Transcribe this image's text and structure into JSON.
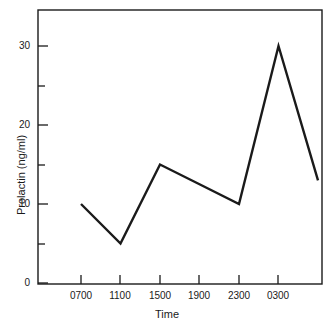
{
  "chart_data": {
    "type": "line",
    "title": "",
    "xlabel": "Time",
    "ylabel": "Prolactin (ng/ml)",
    "categories": [
      "0700",
      "1100",
      "1500",
      "1900",
      "2300",
      "0300",
      ""
    ],
    "x": [
      0,
      1,
      2,
      3,
      4,
      5,
      6
    ],
    "values": [
      10,
      5,
      15,
      12.5,
      10,
      30,
      13
    ],
    "series": [
      {
        "name": "Prolactin",
        "values": [
          10,
          5,
          15,
          12.5,
          10,
          30,
          13
        ],
        "color": "#1a1a1a"
      }
    ],
    "ylim": [
      0,
      35
    ],
    "xlim": [
      -0.1,
      6.05
    ],
    "ytick_values": [
      0,
      10,
      20,
      30
    ],
    "ytick_labels": [
      "0",
      "10",
      "20",
      "30"
    ],
    "yminor_tick_values": [
      5,
      15,
      25
    ],
    "xtick_labels": [
      "0700",
      "1100",
      "1500",
      "1900",
      "2300",
      "0300"
    ],
    "grid": false,
    "legend": false,
    "legend_position": "none",
    "frame": true,
    "line_color": "#1a1a1a",
    "line_width": 2.2,
    "background": "#ffffff"
  },
  "axes": {
    "x_title": "Time",
    "y_title": "Prolactin (ng/ml)",
    "y_labels": [
      "30",
      "20",
      "10",
      "0"
    ],
    "x_labels": [
      "0700",
      "1100",
      "1500",
      "1900",
      "2300",
      "0300"
    ]
  }
}
